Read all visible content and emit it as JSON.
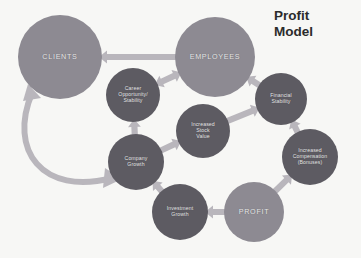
{
  "title": {
    "line1": "Profit",
    "line2": "Model"
  },
  "colors": {
    "background": "#f7f7f5",
    "node_light": "#8d8a92",
    "node_mid": "#7c7a82",
    "node_dark": "#5d5b62",
    "node_darker": "#4f4d54",
    "arrow": "#b9b6bc",
    "arrow_dark": "#a9a6ad",
    "label_text": "#e9e9ea",
    "title_text": "#2b2b2b"
  },
  "diagram": {
    "type": "causal-loop",
    "nodes": [
      {
        "id": "clients",
        "label": "CLIENTS",
        "cx": 60,
        "cy": 57,
        "r": 42,
        "size": "big",
        "shade": "node_light"
      },
      {
        "id": "employees",
        "label": "EMPLOYEES",
        "cx": 215,
        "cy": 57,
        "r": 40,
        "size": "big",
        "shade": "node_light"
      },
      {
        "id": "career",
        "label": "Career\nOpportunity/\nStability",
        "cx": 133,
        "cy": 95,
        "r": 27,
        "size": "small",
        "shade": "node_dark"
      },
      {
        "id": "financial",
        "label": "Financial\nStability",
        "cx": 281,
        "cy": 99,
        "r": 26,
        "size": "small",
        "shade": "node_dark"
      },
      {
        "id": "stock",
        "label": "Increased\nStock\nValue",
        "cx": 203,
        "cy": 131,
        "r": 27,
        "size": "small",
        "shade": "node_dark"
      },
      {
        "id": "compensation",
        "label": "Increased\nCompensation\n(Bonuses)",
        "cx": 310,
        "cy": 157,
        "r": 28,
        "size": "small",
        "shade": "node_dark"
      },
      {
        "id": "company",
        "label": "Company\nGrowth",
        "cx": 136,
        "cy": 162,
        "r": 28,
        "size": "small",
        "shade": "node_dark"
      },
      {
        "id": "investment",
        "label": "Investment\nGrowth",
        "cx": 180,
        "cy": 212,
        "r": 28,
        "size": "small",
        "shade": "node_dark"
      },
      {
        "id": "profit",
        "label": "PROFIT",
        "cx": 254,
        "cy": 212,
        "r": 30,
        "size": "big",
        "shade": "node_light"
      }
    ],
    "arrows": [
      {
        "id": "employees-to-clients",
        "from": "employees",
        "to": "clients",
        "style": "straight",
        "heads": "single"
      },
      {
        "id": "career-to-employees",
        "from": "career",
        "to": "employees",
        "style": "straight",
        "heads": "double"
      },
      {
        "id": "company-to-career",
        "from": "company",
        "to": "career",
        "style": "straight",
        "heads": "single"
      },
      {
        "id": "company-to-stock",
        "from": "company",
        "to": "stock",
        "style": "straight",
        "heads": "single"
      },
      {
        "id": "stock-to-financial",
        "from": "stock",
        "to": "financial",
        "style": "straight",
        "heads": "single"
      },
      {
        "id": "financial-to-employees",
        "from": "financial",
        "to": "employees",
        "style": "straight",
        "heads": "single"
      },
      {
        "id": "compensation-to-financial",
        "from": "compensation",
        "to": "financial",
        "style": "straight",
        "heads": "single"
      },
      {
        "id": "profit-to-compensation",
        "from": "profit",
        "to": "compensation",
        "style": "straight",
        "heads": "single"
      },
      {
        "id": "profit-to-investment",
        "from": "profit",
        "to": "investment",
        "style": "straight",
        "heads": "single"
      },
      {
        "id": "investment-to-company",
        "from": "investment",
        "to": "company",
        "style": "straight",
        "heads": "single"
      },
      {
        "id": "clients-company-loop",
        "from": "clients",
        "to": "company",
        "style": "curved",
        "heads": "double"
      }
    ]
  }
}
